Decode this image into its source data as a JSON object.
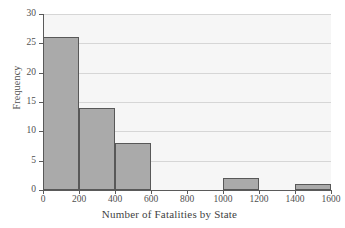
{
  "chart_data": {
    "type": "bar",
    "title": "",
    "subtitle": "",
    "xlabel": "Number of Fatalities by State",
    "ylabel": "Frequency",
    "xlim": [
      0,
      1600
    ],
    "ylim": [
      0,
      30
    ],
    "grid": true,
    "legend": null,
    "legend_position": "none",
    "bin_width": 200,
    "bin_edges": [
      0,
      200,
      400,
      600,
      800,
      1000,
      1200,
      1400,
      1600
    ],
    "categories": [
      "0-200",
      "200-400",
      "400-600",
      "600-800",
      "800-1000",
      "1000-1200",
      "1200-1400",
      "1400-1600"
    ],
    "values": [
      26,
      14,
      8,
      0,
      0,
      2,
      0,
      1
    ],
    "bars": [
      {
        "label": "0-200",
        "x0": 0,
        "x1": 200,
        "value": 26
      },
      {
        "label": "200-400",
        "x0": 200,
        "x1": 400,
        "value": 14
      },
      {
        "label": "400-600",
        "x0": 400,
        "x1": 600,
        "value": 8
      },
      {
        "label": "600-800",
        "x0": 600,
        "x1": 800,
        "value": 0
      },
      {
        "label": "800-1000",
        "x0": 800,
        "x1": 1000,
        "value": 0
      },
      {
        "label": "1000-1200",
        "x0": 1000,
        "x1": 1200,
        "value": 2
      },
      {
        "label": "1200-1400",
        "x0": 1200,
        "x1": 1400,
        "value": 0
      },
      {
        "label": "1400-1600",
        "x0": 1400,
        "x1": 1600,
        "value": 1
      }
    ],
    "xticks": [
      0,
      200,
      400,
      600,
      800,
      1000,
      1200,
      1400,
      1600
    ],
    "xtick_labels": [
      "0",
      "200",
      "400",
      "600",
      "800",
      "1000",
      "1200",
      "1400",
      "1600"
    ],
    "yticks": [
      0,
      5,
      10,
      15,
      20,
      25,
      30
    ],
    "ytick_labels": [
      "0",
      "5",
      "10",
      "15",
      "20",
      "25",
      "30"
    ],
    "colors": {
      "bar_fill": "#aaaaaa",
      "bar_edge": "#585858",
      "plot_background": "#f6f6f6",
      "gridline": "#d6d6d6",
      "axis": "#5a5a5a",
      "text": "#4f4f4f",
      "figure_background": "#ffffff"
    }
  }
}
